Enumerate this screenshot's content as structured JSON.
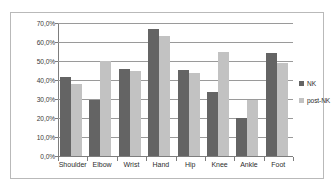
{
  "chart_data": {
    "type": "bar",
    "title": "",
    "subtitle": "",
    "xlabel": "",
    "ylabel": "",
    "categories": [
      "Shoulder",
      "Elbow",
      "Wrist",
      "Hand",
      "Hip",
      "Knee",
      "Ankle",
      "Foot"
    ],
    "series": [
      {
        "name": "NK",
        "color": "#646464",
        "values": [
          41.5,
          29.5,
          46.0,
          67.0,
          45.5,
          33.5,
          20.0,
          54.0
        ]
      },
      {
        "name": "post-NK",
        "color": "#c2c2c2",
        "values": [
          38.0,
          50.0,
          45.0,
          63.0,
          43.5,
          55.0,
          29.5,
          49.0
        ]
      }
    ],
    "ylim": [
      0,
      70
    ],
    "ytick_values": [
      0,
      10,
      20,
      30,
      40,
      50,
      60,
      70
    ],
    "ytick_labels": [
      "0,0%",
      "10,0%",
      "20,0%",
      "30,0%",
      "40,0%",
      "50,0%",
      "60,0%",
      "70,0%"
    ],
    "grid": true,
    "grid_axis": "y",
    "legend_position": "right",
    "legend": [
      {
        "label": "NK",
        "swatch": "legend-swatch-nk"
      },
      {
        "label": "post-NK",
        "swatch": "legend-swatch-post-nk"
      }
    ]
  },
  "colors": {
    "series_nk": "#646464",
    "series_post_nk": "#c2c2c2",
    "gridline": "#9a9a9a",
    "axis": "#7d7d7d",
    "border": "#b9b9b9",
    "background": "#ffffff",
    "text": "#2d2d2d"
  }
}
